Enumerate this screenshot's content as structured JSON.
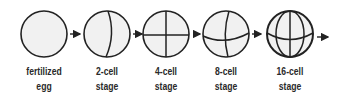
{
  "diagram": {
    "stages": [
      {
        "line1": "fertilized",
        "line2": "egg",
        "icon": "fertilized-egg-icon"
      },
      {
        "line1": "2-cell",
        "line2": "stage",
        "icon": "two-cell-icon"
      },
      {
        "line1": "4-cell",
        "line2": "stage",
        "icon": "four-cell-icon"
      },
      {
        "line1": "8-cell",
        "line2": "stage",
        "icon": "eight-cell-icon"
      },
      {
        "line1": "16-cell",
        "line2": "stage",
        "icon": "sixteen-cell-icon"
      }
    ],
    "colors": {
      "stroke": "#222222",
      "fill": "#f1f1f1"
    }
  }
}
